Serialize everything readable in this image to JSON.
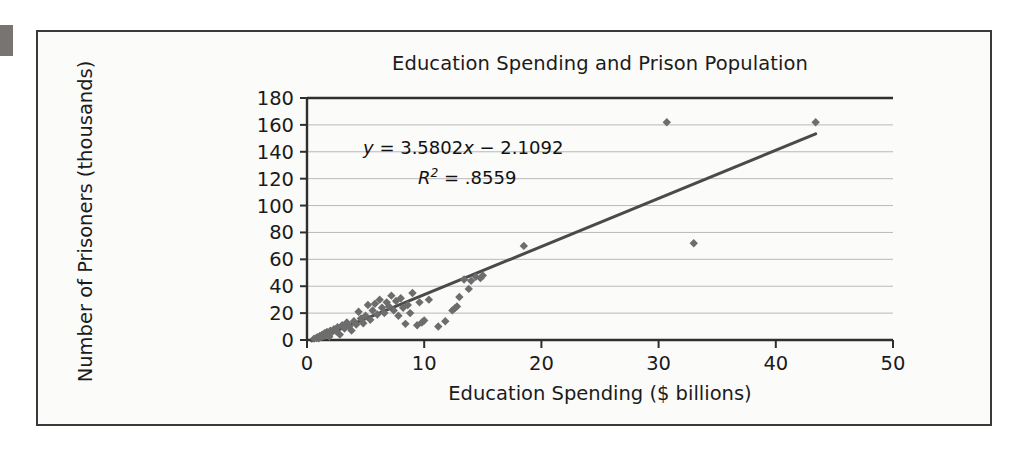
{
  "figure": {
    "background_color": "#fbfbfa",
    "frame_color": "#3a3a3a",
    "edge_tab_color": "#777471"
  },
  "chart_data": {
    "type": "scatter",
    "title": "Education Spending and Prison Population",
    "xlabel": "Education Spending ($ billions)",
    "ylabel": "Number of Prisoners (thousands)",
    "xlim": [
      0,
      50
    ],
    "ylim": [
      0,
      180
    ],
    "xticks": [
      0,
      10,
      20,
      30,
      40,
      50
    ],
    "yticks": [
      0,
      20,
      40,
      60,
      80,
      100,
      120,
      140,
      160,
      180
    ],
    "grid": "horizontal",
    "grid_color": "#b9b9b9",
    "legend": "none",
    "marker": "diamond",
    "marker_color": "#6d6d6d",
    "marker_size": 6,
    "annotations": {
      "equation": "y = 3.5802x − 2.1092",
      "equation_slope": 3.5802,
      "equation_intercept": -2.1092,
      "r_squared_label": "R2 = .8559",
      "r_squared_value": 0.8559
    },
    "trendline": {
      "type": "linear",
      "color": "#4a4a4a",
      "width": 3,
      "x_start": 0.4,
      "x_end": 43.4,
      "y_start": -0.68,
      "y_end": 153.3
    },
    "points": [
      [
        0.6,
        1.0
      ],
      [
        0.8,
        1.5
      ],
      [
        0.9,
        2.0
      ],
      [
        1.0,
        1.2
      ],
      [
        1.1,
        3.0
      ],
      [
        1.2,
        2.2
      ],
      [
        1.3,
        4.0
      ],
      [
        1.4,
        2.8
      ],
      [
        1.5,
        5.0
      ],
      [
        1.6,
        3.5
      ],
      [
        1.7,
        6.0
      ],
      [
        1.8,
        4.5
      ],
      [
        1.9,
        2.5
      ],
      [
        2.0,
        7.0
      ],
      [
        2.1,
        5.5
      ],
      [
        2.3,
        8.0
      ],
      [
        2.5,
        6.5
      ],
      [
        2.6,
        9.5
      ],
      [
        2.8,
        4.0
      ],
      [
        3.0,
        11.0
      ],
      [
        3.2,
        8.5
      ],
      [
        3.4,
        13.0
      ],
      [
        3.6,
        10.0
      ],
      [
        3.8,
        7.0
      ],
      [
        4.0,
        14.0
      ],
      [
        4.2,
        11.5
      ],
      [
        4.4,
        21.0
      ],
      [
        4.6,
        16.0
      ],
      [
        4.8,
        12.5
      ],
      [
        5.0,
        18.0
      ],
      [
        5.2,
        26.0
      ],
      [
        5.4,
        15.0
      ],
      [
        5.6,
        22.0
      ],
      [
        5.8,
        27.0
      ],
      [
        6.0,
        19.0
      ],
      [
        6.2,
        30.0
      ],
      [
        6.4,
        24.0
      ],
      [
        6.6,
        20.0
      ],
      [
        6.8,
        28.0
      ],
      [
        7.0,
        25.0
      ],
      [
        7.2,
        33.0
      ],
      [
        7.4,
        22.0
      ],
      [
        7.6,
        29.0
      ],
      [
        7.8,
        18.0
      ],
      [
        8.0,
        31.0
      ],
      [
        8.2,
        24.0
      ],
      [
        8.4,
        12.0
      ],
      [
        8.6,
        26.0
      ],
      [
        8.8,
        20.0
      ],
      [
        9.0,
        35.0
      ],
      [
        9.4,
        11.0
      ],
      [
        9.6,
        28.0
      ],
      [
        9.8,
        13.0
      ],
      [
        10.0,
        14.5
      ],
      [
        10.4,
        30.0
      ],
      [
        11.2,
        10.0
      ],
      [
        11.8,
        14.0
      ],
      [
        12.4,
        22.0
      ],
      [
        12.6,
        23.5
      ],
      [
        12.8,
        25.0
      ],
      [
        13.0,
        32.0
      ],
      [
        13.4,
        45.0
      ],
      [
        13.8,
        38.0
      ],
      [
        14.0,
        44.0
      ],
      [
        14.4,
        47.0
      ],
      [
        14.8,
        46.0
      ],
      [
        15.0,
        48.0
      ],
      [
        18.5,
        70.0
      ],
      [
        30.7,
        162.0
      ],
      [
        33.0,
        72.0
      ],
      [
        43.4,
        162.0
      ]
    ]
  }
}
